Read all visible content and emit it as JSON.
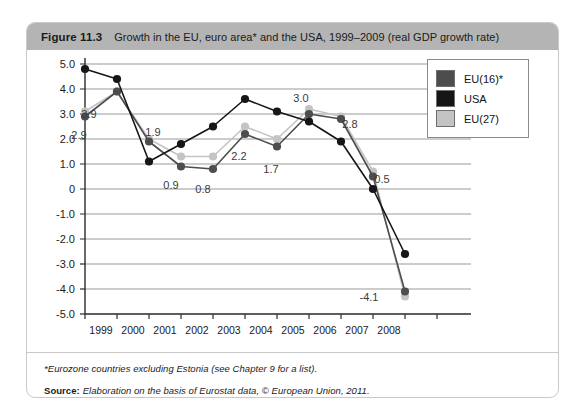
{
  "figure": {
    "number": "Figure 11.3",
    "title": "Growth in the EU, euro area* and the USA, 1999–2009 (real GDP growth rate)"
  },
  "legend": {
    "position": "top-right",
    "items": [
      {
        "label": "EU(16)*",
        "color": "#4d4d4d",
        "name": "eu16"
      },
      {
        "label": "USA",
        "color": "#161616",
        "name": "usa"
      },
      {
        "label": "EU(27)",
        "color": "#c4c4c4",
        "name": "eu27"
      }
    ]
  },
  "footer": {
    "footnote": "*Eurozone countries excluding Estonia (see Chapter 9 for a list).",
    "source_label": "Source:",
    "source_text": "Elaboration on the basis of Eurostat data, © European Union, 2011."
  },
  "chart_data": {
    "type": "line",
    "title": "Growth in the EU, euro area* and the USA, 1999–2009 (real GDP growth rate)",
    "xlabel": "",
    "ylabel": "",
    "grid": true,
    "legend_position": "top-right",
    "x": [
      1999,
      2000,
      2001,
      2002,
      2003,
      2004,
      2005,
      2006,
      2007,
      2008,
      2009
    ],
    "xtick_labels": [
      "1999",
      "2000",
      "2001",
      "2002",
      "2003",
      "2004",
      "2005",
      "2006",
      "2007",
      "2008"
    ],
    "ylim": [
      -5.0,
      5.0
    ],
    "ytick_labels": [
      "5.0",
      "4.0",
      "3.0",
      "2.0",
      "1.0",
      "0",
      "-1.0",
      "-2.0",
      "-3.0",
      "-4.0",
      "-5.0"
    ],
    "ytick_values": [
      5.0,
      4.0,
      3.0,
      2.0,
      1.0,
      0,
      -1.0,
      -2.0,
      -3.0,
      -4.0,
      -5.0
    ],
    "series": [
      {
        "name": "EU(16)*",
        "color": "#4d4d4d",
        "values": [
          2.9,
          3.9,
          1.9,
          0.9,
          0.8,
          2.2,
          1.7,
          3.0,
          2.8,
          0.5,
          -4.1
        ]
      },
      {
        "name": "USA",
        "color": "#161616",
        "values": [
          4.8,
          4.4,
          1.1,
          1.8,
          2.5,
          3.6,
          3.1,
          2.7,
          1.9,
          0.0,
          -2.6
        ]
      },
      {
        "name": "EU(27)",
        "color": "#c4c4c4",
        "values": [
          3.1,
          3.9,
          2.0,
          1.3,
          1.3,
          2.5,
          2.0,
          3.2,
          2.9,
          0.7,
          -4.3
        ]
      }
    ],
    "point_labels": [
      {
        "text": "2.9",
        "x": 1999,
        "y": 2.9,
        "dx": -6,
        "dy": 22
      },
      {
        "text": "3.9",
        "x": 2000,
        "y": 3.9,
        "dx": -28,
        "dy": 26
      },
      {
        "text": "1.9",
        "x": 2001,
        "y": 1.9,
        "dx": 4,
        "dy": -6
      },
      {
        "text": "0.9",
        "x": 2002,
        "y": 0.9,
        "dx": -10,
        "dy": 22
      },
      {
        "text": "0.8",
        "x": 2003,
        "y": 0.8,
        "dx": -10,
        "dy": 24
      },
      {
        "text": "2.2",
        "x": 2004,
        "y": 2.2,
        "dx": -6,
        "dy": 26
      },
      {
        "text": "1.7",
        "x": 2005,
        "y": 1.7,
        "dx": -6,
        "dy": 26
      },
      {
        "text": "3.0",
        "x": 2006,
        "y": 3.0,
        "dx": -8,
        "dy": -12
      },
      {
        "text": "2.8",
        "x": 2007,
        "y": 2.8,
        "dx": 9,
        "dy": 9
      },
      {
        "text": "0.5",
        "x": 2008,
        "y": 0.5,
        "dx": 9,
        "dy": 6
      },
      {
        "text": "-4.1",
        "x": 2009,
        "y": -4.1,
        "dx": -36,
        "dy": 9
      }
    ]
  }
}
